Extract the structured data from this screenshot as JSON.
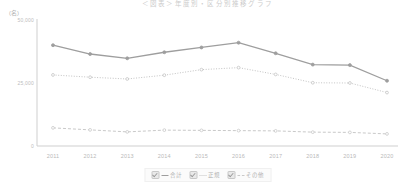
{
  "chart_data": {
    "type": "line",
    "title": "＜図表＞年度別・区分別推移グラフ",
    "unit_label": "(名)",
    "xlabel": "",
    "ylabel": "",
    "categories": [
      "2011",
      "2012",
      "2013",
      "2014",
      "2015",
      "2016",
      "2017",
      "2018",
      "2019",
      "2020"
    ],
    "ytick_labels": [
      "50,000",
      "25,000",
      "0"
    ],
    "ytick_values": [
      50000,
      25000,
      0
    ],
    "ylim": [
      0,
      50000
    ],
    "grid": false,
    "legend_position": "bottom",
    "series": [
      {
        "name": "合計",
        "style": "solid",
        "color": "#9e9e9e",
        "values": [
          40000,
          36500,
          34800,
          37200,
          39100,
          41000,
          36800,
          32300,
          32100,
          25900
        ]
      },
      {
        "name": "正規",
        "style": "dotted",
        "color": "#c4c4c4",
        "values": [
          28200,
          27300,
          26600,
          28100,
          30300,
          31100,
          28400,
          25100,
          25000,
          21200
        ]
      },
      {
        "name": "その他",
        "style": "dashed",
        "color": "#c9c9c9",
        "values": [
          7200,
          6400,
          5600,
          6300,
          6200,
          6100,
          6000,
          5500,
          5400,
          4800
        ]
      }
    ]
  },
  "legend": {
    "items": [
      {
        "label": "合計",
        "checked": true
      },
      {
        "label": "正規",
        "checked": true
      },
      {
        "label": "その他",
        "checked": true
      }
    ]
  }
}
